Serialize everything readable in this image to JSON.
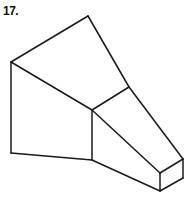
{
  "figure": {
    "number_label": "17.",
    "stroke_color": "#1a1a1a",
    "background": "#ffffff"
  },
  "vertices": {
    "top": [
      88,
      16
    ],
    "left_top": [
      11,
      62
    ],
    "left_bottom": [
      11,
      153
    ],
    "mid_top": [
      92,
      110
    ],
    "mid_bottom": [
      92,
      160
    ],
    "right_upper": [
      129,
      87
    ],
    "box_front_top": [
      160,
      173
    ],
    "box_right_top": [
      183,
      159
    ],
    "box_right_bottom": [
      183,
      178
    ],
    "box_front_bottom": [
      160,
      191
    ]
  },
  "edges": [
    [
      "left_top",
      "top"
    ],
    [
      "top",
      "right_upper"
    ],
    [
      "right_upper",
      "box_right_top"
    ],
    [
      "left_top",
      "mid_top"
    ],
    [
      "mid_top",
      "right_upper"
    ],
    [
      "left_top",
      "left_bottom"
    ],
    [
      "left_bottom",
      "mid_bottom"
    ],
    [
      "mid_top",
      "mid_bottom"
    ],
    [
      "mid_top",
      "box_front_top"
    ],
    [
      "mid_bottom",
      "box_front_bottom"
    ],
    [
      "box_front_top",
      "box_right_top"
    ],
    [
      "box_right_top",
      "box_right_bottom"
    ],
    [
      "box_right_bottom",
      "box_front_bottom"
    ],
    [
      "box_front_top",
      "box_front_bottom"
    ]
  ]
}
